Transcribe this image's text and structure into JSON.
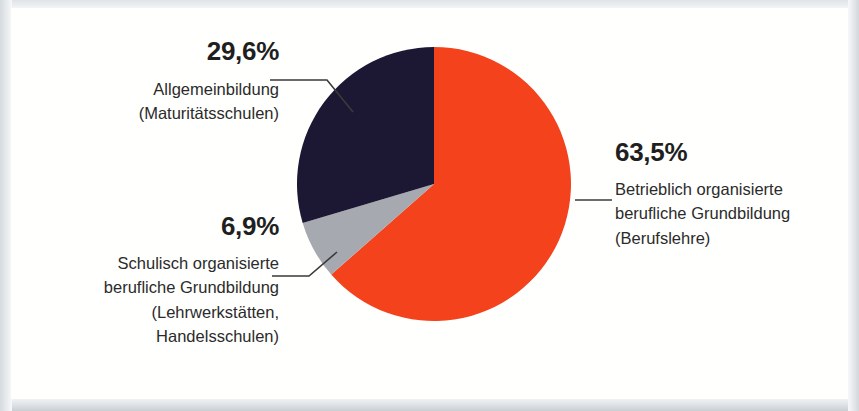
{
  "chart_data": {
    "type": "pie",
    "title": "",
    "subtitle": "",
    "xlabel": "",
    "ylabel": "",
    "grid": false,
    "legend_position": "callout-labels",
    "start_angle_deg": 0,
    "direction": "clockwise",
    "categories": [
      "Betrieblich organisierte berufliche Grundbildung (Berufslehre)",
      "Schulisch organisierte berufliche Grundbildung (Lehrwerkstätten, Handelsschulen)",
      "Allgemeinbildung (Maturitätsschulen)"
    ],
    "values": [
      63.5,
      6.9,
      29.6
    ],
    "value_labels": [
      "63,5%",
      "6,9%",
      "29,6%"
    ],
    "colors": [
      "#f4421c",
      "#a7a9b0",
      "#1c1833"
    ],
    "units": "percent",
    "slices": [
      {
        "percent_label": "63,5%",
        "value": 63.5,
        "color": "#f4421c",
        "lines": [
          "Betrieblich organisierte",
          "berufliche Grundbildung",
          "(Berufslehre)"
        ],
        "start_deg": 0,
        "end_deg": 228.6
      },
      {
        "percent_label": "6,9%",
        "value": 6.9,
        "color": "#a7a9b0",
        "lines": [
          "Schulisch organisierte",
          "berufliche Grundbildung",
          "(Lehrwerkstätten,",
          "Handelsschulen)"
        ],
        "start_deg": 228.6,
        "end_deg": 253.4
      },
      {
        "percent_label": "29,6%",
        "value": 29.6,
        "color": "#1c1833",
        "lines": [
          "Allgemeinbildung",
          "(Maturitätsschulen)"
        ],
        "start_deg": 253.4,
        "end_deg": 360
      }
    ]
  },
  "labels": {
    "allgemeinbildung": {
      "percent": "29,6%",
      "line1": "Allgemeinbildung",
      "line2": "(Maturitätsschulen)"
    },
    "schulisch": {
      "percent": "6,9%",
      "line1": "Schulisch organisierte",
      "line2": "berufliche Grundbildung",
      "line3": "(Lehrwerkstätten,",
      "line4": "Handelsschulen)"
    },
    "betrieblich": {
      "percent": "63,5%",
      "line1": "Betrieblich organisierte",
      "line2": "berufliche Grundbildung",
      "line3": "(Berufslehre)"
    }
  },
  "style": {
    "slice_orange": "#f4421c",
    "slice_grey": "#a7a9b0",
    "slice_navy": "#1c1833",
    "leader_line": "#3a3a3a",
    "text": "#242424",
    "canvas_bg": "#fffffe",
    "frame_bg": "#e3e6e9"
  }
}
